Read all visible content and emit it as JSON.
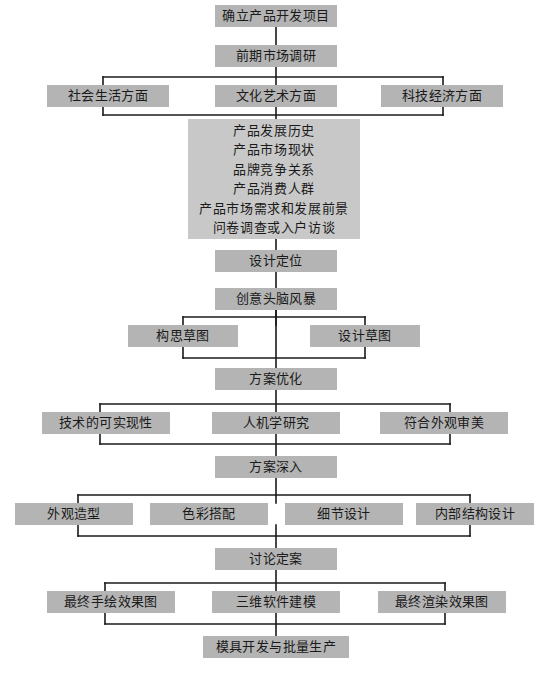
{
  "diagram": {
    "title_text": "产品开发设计流程图",
    "colors": {
      "box_fill": "#b4b4b4",
      "panel_fill": "#c8c8c8",
      "line": "#1a1a1a",
      "text": "#1a1a1a",
      "background": "#ffffff"
    },
    "nodes": [
      {
        "id": "n1",
        "label": "确立产品开发项目",
        "x": 215,
        "y": 5,
        "w": 122,
        "h": 22
      },
      {
        "id": "n2",
        "label": "前期市场调研",
        "x": 215,
        "y": 45,
        "w": 122,
        "h": 22
      },
      {
        "id": "n3a",
        "label": "社会生活方面",
        "x": 47,
        "y": 85,
        "w": 122,
        "h": 22
      },
      {
        "id": "n3b",
        "label": "文化艺术方面",
        "x": 215,
        "y": 85,
        "w": 122,
        "h": 22
      },
      {
        "id": "n3c",
        "label": "科技经济方面",
        "x": 381,
        "y": 85,
        "w": 122,
        "h": 22
      },
      {
        "id": "n5",
        "label": "设计定位",
        "x": 215,
        "y": 250,
        "w": 122,
        "h": 22
      },
      {
        "id": "n6",
        "label": "创意头脑风暴",
        "x": 215,
        "y": 288,
        "w": 122,
        "h": 22
      },
      {
        "id": "n7a",
        "label": "构思草图",
        "x": 128,
        "y": 325,
        "w": 110,
        "h": 22
      },
      {
        "id": "n7b",
        "label": "设计草图",
        "x": 310,
        "y": 325,
        "w": 110,
        "h": 22
      },
      {
        "id": "n8",
        "label": "方案优化",
        "x": 215,
        "y": 368,
        "w": 122,
        "h": 22
      },
      {
        "id": "n9a",
        "label": "技术的可实现性",
        "x": 42,
        "y": 412,
        "w": 128,
        "h": 22
      },
      {
        "id": "n9b",
        "label": "人机学研究",
        "x": 212,
        "y": 412,
        "w": 128,
        "h": 22
      },
      {
        "id": "n9c",
        "label": "符合外观审美",
        "x": 380,
        "y": 412,
        "w": 128,
        "h": 22
      },
      {
        "id": "n10",
        "label": "方案深入",
        "x": 215,
        "y": 456,
        "w": 122,
        "h": 22
      },
      {
        "id": "n11a",
        "label": "外观造型",
        "x": 15,
        "y": 503,
        "w": 118,
        "h": 22
      },
      {
        "id": "n11b",
        "label": "色彩搭配",
        "x": 150,
        "y": 503,
        "w": 118,
        "h": 22
      },
      {
        "id": "n11c",
        "label": "细节设计",
        "x": 285,
        "y": 503,
        "w": 118,
        "h": 22
      },
      {
        "id": "n11d",
        "label": "内部结构设计",
        "x": 416,
        "y": 503,
        "w": 118,
        "h": 22
      },
      {
        "id": "n12",
        "label": "讨论定案",
        "x": 215,
        "y": 548,
        "w": 122,
        "h": 22
      },
      {
        "id": "n13a",
        "label": "最终手绘效果图",
        "x": 47,
        "y": 591,
        "w": 128,
        "h": 22
      },
      {
        "id": "n13b",
        "label": "三维软件建模",
        "x": 212,
        "y": 591,
        "w": 128,
        "h": 22
      },
      {
        "id": "n13c",
        "label": "最终渲染效果图",
        "x": 378,
        "y": 591,
        "w": 128,
        "h": 22
      },
      {
        "id": "n14",
        "label": "模具开发与批量生产",
        "x": 203,
        "y": 636,
        "w": 146,
        "h": 22
      }
    ],
    "panel": {
      "id": "n4",
      "x": 188,
      "y": 119,
      "w": 172,
      "h": 120,
      "lines": [
        "产品发展历史",
        "产品市场现状",
        "品牌竞争关系",
        "产品消费人群",
        "产品市场需求和发展前景",
        "问卷调查或入户访谈"
      ]
    },
    "wires": {
      "stroke": "#1a1a1a",
      "width": 1.6,
      "segments": [
        "M276,27 L276,45",
        "M276,67 L276,85",
        "M103,77 L443,77",
        "M103,77 L103,85",
        "M443,77 L443,85",
        "M103,107 L103,115",
        "M443,107 L443,115",
        "M103,115 L443,115",
        "M276,107 L276,119",
        "M276,239 L276,250",
        "M276,272 L276,288",
        "M276,310 L276,325",
        "M183,317 L365,317",
        "M183,317 L183,325",
        "M365,317 L365,325",
        "M183,347 L183,358",
        "M365,347 L365,358",
        "M183,358 L365,358",
        "M276,310 L276,368",
        "M276,390 L276,412",
        "M100,404 L450,404",
        "M100,404 L100,412",
        "M450,404 L450,412",
        "M100,434 L100,444",
        "M450,434 L450,444",
        "M100,444 L450,444",
        "M276,434 L276,456",
        "M276,478 L276,503",
        "M78,495 L470,495",
        "M78,495 L78,503",
        "M470,495 L470,503",
        "M78,525 L78,536",
        "M470,525 L470,536",
        "M78,536 L470,536",
        "M276,525 L276,548",
        "M276,570 L276,591",
        "M105,583 L445,583",
        "M105,583 L105,591",
        "M445,583 L445,591",
        "M105,613 L105,624",
        "M445,613 L445,624",
        "M105,624 L445,624",
        "M276,613 L276,636"
      ]
    }
  }
}
